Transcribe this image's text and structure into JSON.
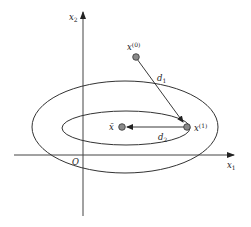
{
  "diagram": {
    "type": "optimization-iteration-contour",
    "colors": {
      "line": "#333333",
      "axis": "#444444",
      "point_fill": "#8a8a8a",
      "point_stroke": "#333333",
      "background": "#ffffff"
    },
    "axes": {
      "x_label": "x",
      "x_sub": "1",
      "y_label": "x",
      "y_sub": "2",
      "origin_label": "O"
    },
    "contours": [
      {
        "name": "outer",
        "cx": 125,
        "cy": 127,
        "rx": 93,
        "ry": 46
      },
      {
        "name": "inner",
        "cx": 126,
        "cy": 128,
        "rx": 64,
        "ry": 17
      }
    ],
    "points": {
      "x0": {
        "label": "x",
        "sup": "(0)",
        "x": 136,
        "y": 57
      },
      "x1": {
        "label": "x",
        "sup": "(1)",
        "x": 187,
        "y": 127
      },
      "xbar": {
        "label": "x̄",
        "x": 122,
        "y": 127
      }
    },
    "arrows": {
      "d1": {
        "label": "d",
        "sub": "1"
      },
      "d2": {
        "label": "d",
        "sub": "2"
      }
    }
  }
}
